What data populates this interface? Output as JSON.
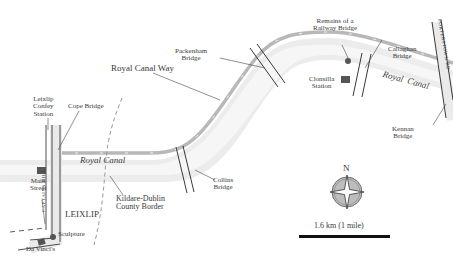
{
  "map": {
    "route_label": "Royal Canal Way",
    "canal_label_west": [
      "Royal",
      "Canal"
    ],
    "canal_label_east": [
      "Royal",
      "Canal"
    ],
    "town": "LEIXLIP",
    "road_west": "CAPTAINS HILL",
    "road_east": "PORTERSTOWN RD",
    "border": [
      "Kildare-Dublin",
      "County Border"
    ],
    "places": {
      "leixlip_confey": [
        "Leixlip",
        "Confey",
        "Station"
      ],
      "cope_bridge": "Cope Bridge",
      "main_street": [
        "Main",
        "Street"
      ],
      "sculpture": "Sculpture",
      "da_vincis": "Da Vinci's",
      "collins_bridge": [
        "Collins",
        "Bridge"
      ],
      "packenham_bridge": [
        "Packenham",
        "Bridge"
      ],
      "remains": [
        "Remains of a",
        "Railway Bridge"
      ],
      "clonsilla": [
        "Clonsilla",
        "Station"
      ],
      "callaghan": [
        "Callaghan",
        "Bridge"
      ],
      "kennan": [
        "Kennan",
        "Bridge"
      ]
    },
    "compass": {
      "north": "N"
    },
    "scale": {
      "label": "1.6 km (1 mile)"
    },
    "colors": {
      "canal": "#e6e6e6",
      "path": "#b5b5b5",
      "lines": "#222222",
      "text": "#3a3a3a"
    }
  }
}
